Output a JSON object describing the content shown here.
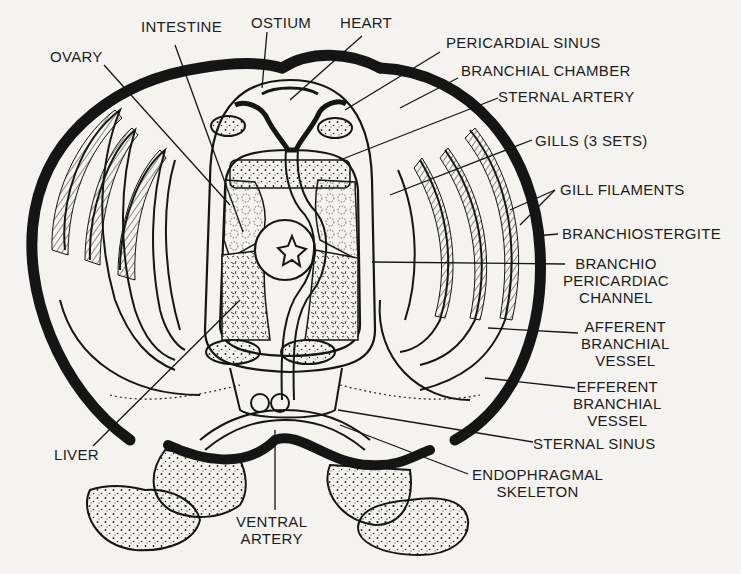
{
  "diagram": {
    "ink_color": "#151515",
    "paper_color": "#f4f3ef",
    "labels": {
      "intestine": "INTESTINE",
      "ostium": "OSTIUM",
      "heart": "HEART",
      "ovary": "OVARY",
      "pericardial_sinus": "PERICARDIAL SINUS",
      "branchial_chamber": "BRANCHIAL CHAMBER",
      "sternal_artery": "STERNAL ARTERY",
      "gills": "GILLS (3 SETS)",
      "gill_filaments": "GILL FILAMENTS",
      "branchiostergite": "BRANCHIOSTERGITE",
      "branchio_pericardiac_channel": "BRANCHIO\nPERICARDIAC\nCHANNEL",
      "afferent_branchial_vessel": "AFFERENT\nBRANCHIAL\nVESSEL",
      "efferent_branchial_vessel": "EFFERENT\nBRANCHIAL\nVESSEL",
      "sternal_sinus": "STERNAL SINUS",
      "endophragmal_skeleton": "ENDOPHRAGMAL\nSKELETON",
      "liver": "LIVER",
      "ventral_artery": "VENTRAL\nARTERY"
    },
    "gill_sets_count": 3
  }
}
